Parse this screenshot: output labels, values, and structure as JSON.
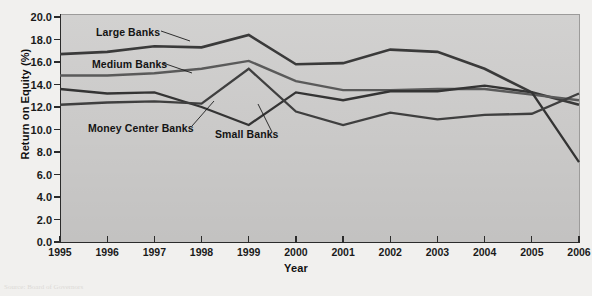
{
  "figure": {
    "background_color": "#f1f0ee",
    "panel_color": "#cdcccb",
    "axis_color": "#2b2b2b"
  },
  "axes": {
    "y_title": "Return on Equity (%)",
    "x_title": "Year",
    "y_ticks": [
      "0.0",
      "2.0",
      "4.0",
      "6.0",
      "8.0",
      "10.0",
      "12.0",
      "14.0",
      "16.0",
      "18.0",
      "20.0"
    ],
    "x_ticks": [
      "1995",
      "1996",
      "1997",
      "1998",
      "1999",
      "2000",
      "2001",
      "2002",
      "2003",
      "2004",
      "2005",
      "2006"
    ]
  },
  "callouts": [
    {
      "name": "large-banks",
      "label": "Large Banks"
    },
    {
      "name": "medium-banks",
      "label": "Medium Banks"
    },
    {
      "name": "money-center-banks",
      "label": "Money Center Banks"
    },
    {
      "name": "small-banks",
      "label": "Small Banks"
    }
  ],
  "ghost_text": [
    "and other the ROE value",
    "capital to the earning",
    "to be about banks of",
    "in the 1995 the bank of",
    "on the equity and the return",
    "the banks return on equity",
    "for the bank of the as the",
    "their ROE as"
  ],
  "caption": "Source:  Board of Governors",
  "chart_data": {
    "type": "line",
    "title": "",
    "xlabel": "Year",
    "ylabel": "Return on Equity (%)",
    "x": [
      1995,
      1996,
      1997,
      1998,
      1999,
      2000,
      2001,
      2002,
      2003,
      2004,
      2005,
      2006
    ],
    "xlim": [
      1995,
      2006
    ],
    "ylim": [
      0.0,
      20.0
    ],
    "ytick_step": 2.0,
    "grid": false,
    "legend": "inline-callout-labels",
    "series": [
      {
        "name": "Large Banks",
        "color": "#3a3a3a",
        "linewidth": 2.6,
        "values": [
          16.7,
          16.9,
          17.4,
          17.3,
          18.4,
          15.8,
          15.9,
          17.1,
          16.9,
          15.4,
          13.3,
          12.2
        ]
      },
      {
        "name": "Medium Banks",
        "color": "#5a5a5a",
        "linewidth": 2.4,
        "values": [
          14.8,
          14.8,
          15.0,
          15.4,
          16.1,
          14.3,
          13.5,
          13.5,
          13.6,
          13.6,
          13.1,
          12.6
        ]
      },
      {
        "name": "Money Center Banks",
        "color": "#343434",
        "linewidth": 2.3,
        "values": [
          13.6,
          13.2,
          13.3,
          12.0,
          10.4,
          13.3,
          12.6,
          13.4,
          13.4,
          13.9,
          13.3,
          7.1
        ]
      },
      {
        "name": "Small Banks",
        "color": "#3f3f3f",
        "linewidth": 2.3,
        "values": [
          12.2,
          12.4,
          12.5,
          12.3,
          15.4,
          11.6,
          10.4,
          11.5,
          10.9,
          11.3,
          11.4,
          13.2
        ]
      }
    ]
  }
}
